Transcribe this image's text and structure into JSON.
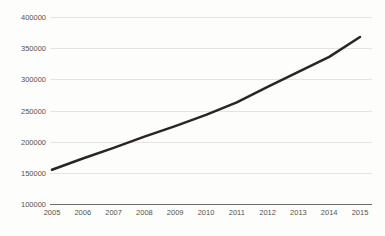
{
  "chart_data": {
    "type": "line",
    "title": "",
    "subtitle": "",
    "xlabel": "",
    "ylabel": "",
    "categories": [
      "2005",
      "2006",
      "2007",
      "2008",
      "2009",
      "2010",
      "2011",
      "2012",
      "2013",
      "2014",
      "2015"
    ],
    "x": [
      2005,
      2006,
      2007,
      2008,
      2009,
      2010,
      2011,
      2012,
      2013,
      2014,
      2015
    ],
    "series": [
      {
        "name": "",
        "values": [
          155000,
          173000,
          190000,
          208000,
          225000,
          243000,
          263000,
          288000,
          312000,
          336000,
          368000
        ],
        "color": "#2a2520",
        "line_width": 2.5
      }
    ],
    "ylim": [
      100000,
      400000
    ],
    "ytick_values": [
      400000,
      350000,
      300000,
      250000,
      200000,
      150000,
      100000
    ],
    "ytick_labels": [
      "400000",
      "350000",
      "300000",
      "250000",
      "200000",
      "150000",
      "100000"
    ],
    "xtick_labels": [
      "2005",
      "2006",
      "2007",
      "2008",
      "2009",
      "2010",
      "2011",
      "2012",
      "2013",
      "2014",
      "2015"
    ],
    "grid": true,
    "grid_axis": "y",
    "grid_color": "#e6e4e0",
    "axis_color": "#6f6d68",
    "legend": false,
    "legend_position": "none",
    "background_color": "#fdfdfb",
    "text_color": "#55524d"
  },
  "figure": {
    "title_clipped": "",
    "title_note": "title row cropped at top edge of screenshot"
  }
}
